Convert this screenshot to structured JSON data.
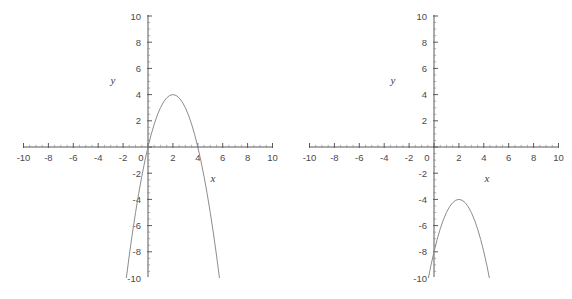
{
  "page": {
    "background": "#ffffff",
    "width": 572,
    "height": 299,
    "axis_color": "#5a5a5a",
    "curve_color": "#8c8c8c",
    "label_color": "#4a4a4a"
  },
  "chart_data": [
    {
      "id": "left",
      "type": "line",
      "title": "",
      "xlabel": "x",
      "ylabel": "y",
      "xlim": [
        -10,
        10
      ],
      "ylim": [
        -10,
        10
      ],
      "grid": false,
      "legend": "none",
      "xticks": [
        -10,
        -8,
        -6,
        -4,
        -2,
        0,
        2,
        4,
        6,
        8,
        10
      ],
      "xticklabels": [
        "-10",
        "-8",
        "-6",
        "-4",
        "-2",
        "0",
        "2",
        "4",
        "6",
        "8",
        "10"
      ],
      "yticks": [
        -10,
        -8,
        -6,
        -4,
        -2,
        2,
        4,
        6,
        8,
        10
      ],
      "yticklabels": [
        "-10",
        "-8",
        "-6",
        "-4",
        "-2",
        "2",
        "4",
        "6",
        "8",
        "10"
      ],
      "minor_tick_step": 0.5,
      "series": [
        {
          "name": "parabola",
          "equation": "y = -(x-2)^2 + 4",
          "vertex": [
            2,
            4
          ],
          "roots": [
            0,
            4
          ],
          "opens": "down",
          "x_domain": [
            -1.742,
            5.742
          ],
          "x": [
            -1.74,
            -1.5,
            -1.25,
            -1.0,
            -0.75,
            -0.5,
            -0.25,
            0.0,
            0.25,
            0.5,
            0.75,
            1.0,
            1.25,
            1.5,
            1.75,
            2.0,
            2.25,
            2.5,
            2.75,
            3.0,
            3.25,
            3.5,
            3.75,
            4.0,
            4.25,
            4.5,
            4.75,
            5.0,
            5.25,
            5.5,
            5.74
          ],
          "y": [
            -10.0,
            -8.25,
            -6.56,
            -5.0,
            -3.56,
            -2.25,
            -1.06,
            0.0,
            0.94,
            1.75,
            2.44,
            3.0,
            3.44,
            3.75,
            3.94,
            4.0,
            3.94,
            3.75,
            3.44,
            3.0,
            2.44,
            1.75,
            0.94,
            0.0,
            -1.06,
            -2.25,
            -3.56,
            -5.0,
            -6.56,
            -8.25,
            -10.0
          ]
        }
      ]
    },
    {
      "id": "right",
      "type": "line",
      "title": "",
      "xlabel": "x",
      "ylabel": "y",
      "xlim": [
        -10,
        10
      ],
      "ylim": [
        -10,
        10
      ],
      "grid": false,
      "legend": "none",
      "xticks": [
        -10,
        -8,
        -6,
        -4,
        -2,
        0,
        2,
        4,
        6,
        8,
        10
      ],
      "xticklabels": [
        "-10",
        "-8",
        "-6",
        "-4",
        "-2",
        "0",
        "2",
        "4",
        "6",
        "8",
        "10"
      ],
      "yticks": [
        -10,
        -8,
        -6,
        -4,
        -2,
        2,
        4,
        6,
        8,
        10
      ],
      "yticklabels": [
        "-10",
        "-8",
        "-6",
        "-4",
        "-2",
        "2",
        "4",
        "6",
        "8",
        "10"
      ],
      "minor_tick_step": 0.5,
      "series": [
        {
          "name": "parabola",
          "equation": "y = -(x-2)^2 - 4",
          "vertex": [
            2,
            -4
          ],
          "roots": [],
          "opens": "down",
          "x_domain": [
            -0.449,
            4.449
          ],
          "x": [
            -0.45,
            -0.25,
            0.0,
            0.25,
            0.5,
            0.75,
            1.0,
            1.25,
            1.5,
            1.75,
            2.0,
            2.25,
            2.5,
            2.75,
            3.0,
            3.25,
            3.5,
            3.75,
            4.0,
            4.25,
            4.45
          ],
          "y": [
            -10.0,
            -9.06,
            -8.0,
            -7.06,
            -6.25,
            -5.56,
            -5.0,
            -4.56,
            -4.25,
            -4.06,
            -4.0,
            -4.06,
            -4.25,
            -4.56,
            -5.0,
            -5.56,
            -6.25,
            -7.06,
            -8.0,
            -9.06,
            -10.0
          ]
        }
      ]
    }
  ]
}
